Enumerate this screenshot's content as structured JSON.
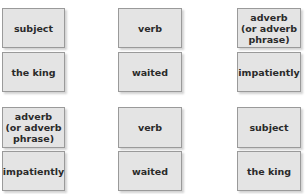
{
  "top_group": {
    "labels": [
      "subject",
      "verb",
      "adverb\n(or adverb\nphrase)"
    ],
    "examples": [
      "the king",
      "waited",
      "impatiently"
    ]
  },
  "bottom_group": {
    "labels": [
      "adverb\n(or adverb\nphrase)",
      "verb",
      "subject"
    ],
    "examples": [
      "impatiently",
      "waited",
      "the king"
    ]
  },
  "colors": {
    "card_fill": "#e4e4e4",
    "card_border": "#9a9a9a",
    "text": "#2a2a2a"
  }
}
